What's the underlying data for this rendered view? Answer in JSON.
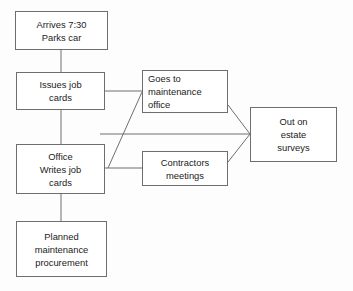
{
  "diagram": {
    "type": "flowchart",
    "stroke_color": "#6e6e6e",
    "text_color": "#1b1b1b",
    "background_color": "#fdfdfd",
    "nodes": [
      {
        "id": "arrives",
        "name": "arrives-parks-car",
        "lines": [
          "Arrives 7:30",
          "Parks car"
        ],
        "align": "center",
        "x": 15,
        "y": 11,
        "w": 93,
        "h": 39
      },
      {
        "id": "issues",
        "name": "issues-job-cards",
        "lines": [
          "Issues job",
          "cards"
        ],
        "align": "center",
        "x": 16,
        "y": 72,
        "w": 89,
        "h": 38
      },
      {
        "id": "goes",
        "name": "goes-to-maintenance-office",
        "lines": [
          "Goes to",
          "maintenance",
          "office"
        ],
        "align": "left",
        "x": 142,
        "y": 70,
        "w": 86,
        "h": 43
      },
      {
        "id": "office",
        "name": "office-writes-job-cards",
        "lines": [
          "Office",
          "Writes job",
          "cards"
        ],
        "align": "center",
        "x": 16,
        "y": 144,
        "w": 89,
        "h": 50
      },
      {
        "id": "contractors",
        "name": "contractors-meetings",
        "lines": [
          "Contractors",
          "meetings"
        ],
        "align": "center",
        "x": 142,
        "y": 151,
        "w": 86,
        "h": 35
      },
      {
        "id": "surveys",
        "name": "out-on-estate-surveys",
        "lines": [
          "Out on",
          "estate",
          "surveys"
        ],
        "align": "center",
        "x": 250,
        "y": 107,
        "w": 87,
        "h": 55
      },
      {
        "id": "planned",
        "name": "planned-maintenance-procurement",
        "lines": [
          "Planned",
          "maintenance",
          "procurement"
        ],
        "align": "center",
        "x": 16,
        "y": 221,
        "w": 91,
        "h": 56
      }
    ],
    "connectors": [
      {
        "name": "connector-arrives-to-issues",
        "kind": "vertical",
        "x1": 61,
        "y1": 50,
        "x2": 61,
        "y2": 72
      },
      {
        "name": "connector-issues-to-office",
        "kind": "vertical",
        "x1": 61,
        "y1": 110,
        "x2": 61,
        "y2": 144
      },
      {
        "name": "connector-office-to-planned",
        "kind": "vertical",
        "x1": 61,
        "y1": 194,
        "x2": 61,
        "y2": 221
      },
      {
        "name": "connector-issues-to-goes",
        "kind": "horizontal",
        "x1": 105,
        "y1": 91,
        "x2": 142,
        "y2": 91
      },
      {
        "name": "connector-office-to-contractors",
        "kind": "horizontal",
        "x1": 105,
        "y1": 168,
        "x2": 142,
        "y2": 168
      },
      {
        "name": "connector-office-to-surveys",
        "kind": "horizontal",
        "x1": 100,
        "y1": 134,
        "x2": 250,
        "y2": 134
      },
      {
        "name": "connector-office-to-goes-diagonal",
        "kind": "diagonal",
        "x1": 108,
        "y1": 168,
        "x2": 142,
        "y2": 92
      },
      {
        "name": "connector-goes-to-surveys-diagonal",
        "kind": "diagonal",
        "x1": 228,
        "y1": 105,
        "x2": 250,
        "y2": 134
      },
      {
        "name": "connector-contractors-to-surveys-diagonal",
        "kind": "diagonal",
        "x1": 228,
        "y1": 162,
        "x2": 250,
        "y2": 134
      }
    ]
  }
}
